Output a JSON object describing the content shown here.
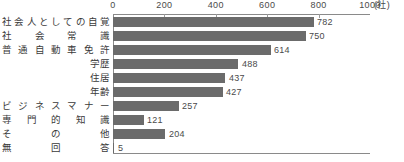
{
  "chart_data": {
    "type": "bar",
    "orientation": "horizontal",
    "title": "",
    "subtitle": "",
    "xlabel": "",
    "ylabel": "",
    "unit_label": "(社)",
    "xlim": [
      0,
      1000
    ],
    "xticks": [
      "0",
      "200",
      "400",
      "600",
      "800",
      "1000"
    ],
    "xtick_values": [
      0,
      200,
      400,
      600,
      800,
      1000
    ],
    "grid": false,
    "legend": false,
    "bar_color": "#6b6b6b",
    "axis_color": "#8a8a8a",
    "text_color": "#3a3a3a",
    "categories": [
      "社会人としての自覚",
      "社会常識",
      "普通自動車免許",
      "学歴",
      "住居",
      "年齢",
      "ビジネスマナー",
      "専門的知識",
      "その他",
      "無回答"
    ],
    "values": [
      782,
      750,
      614,
      488,
      437,
      427,
      257,
      121,
      204,
      5
    ],
    "value_labels": [
      "782",
      "750",
      "614",
      "488",
      "437",
      "427",
      "257",
      "121",
      "204",
      "5"
    ]
  }
}
